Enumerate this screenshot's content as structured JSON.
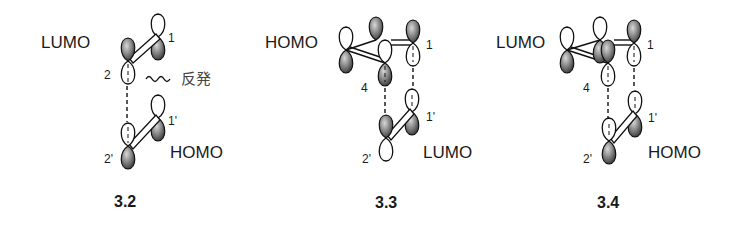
{
  "figures": [
    {
      "id": "3.2",
      "label": "3.2",
      "upper_orbital": "LUMO",
      "lower_orbital": "HOMO",
      "atoms_upper": [
        "1",
        "2"
      ],
      "atoms_lower": [
        "1'",
        "2'"
      ],
      "annotation": "反発",
      "annotation_meaning": "repulsion"
    },
    {
      "id": "3.3",
      "label": "3.3",
      "upper_orbital": "HOMO",
      "lower_orbital": "LUMO",
      "atoms_upper": [
        "1",
        "4"
      ],
      "atoms_lower": [
        "1'",
        "2'"
      ]
    },
    {
      "id": "3.4",
      "label": "3.4",
      "upper_orbital": "LUMO",
      "lower_orbital": "HOMO",
      "atoms_upper": [
        "1",
        "4"
      ],
      "atoms_lower": [
        "1'",
        "2'"
      ]
    }
  ],
  "colors": {
    "line": "#111111",
    "lobe_shade_dark": "#3a3a3a",
    "lobe_shade_light": "#d8d8d8",
    "text": "#1a1a1a",
    "annotation": "#444444"
  }
}
